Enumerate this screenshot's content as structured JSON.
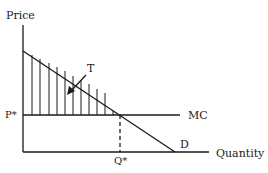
{
  "diagram": {
    "type": "economics-supply-demand",
    "axes": {
      "y_label": "Price",
      "x_label": "Quantity"
    },
    "curves": {
      "marginal_cost_label": "MC",
      "demand_label": "D"
    },
    "equilibrium": {
      "price_label": "P*",
      "quantity_label": "Q*"
    },
    "shaded_region": {
      "label": "T",
      "pattern": "vertical-hatch"
    },
    "colors": {
      "line": "#1a1a1a",
      "background": "#ffffff"
    }
  }
}
